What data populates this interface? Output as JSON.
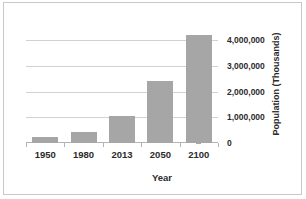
{
  "chart_data": {
    "type": "bar",
    "title": "",
    "xlabel": "Year",
    "ylabel": "Population (Thousands)",
    "categories": [
      "1950",
      "1980",
      "2013",
      "2050",
      "2100"
    ],
    "values": [
      250000,
      440000,
      1050000,
      2400000,
      4200000
    ],
    "series": [
      {
        "name": "Population (Thousands)",
        "values": [
          250000,
          440000,
          1050000,
          2400000,
          4200000
        ]
      }
    ],
    "ylim": [
      0,
      4600000
    ],
    "yticks": [
      0,
      1000000,
      2000000,
      3000000,
      4000000
    ],
    "ytick_labels": [
      "0",
      "1,000,000",
      "2,000,000",
      "3,000,000",
      "4,000,000"
    ],
    "grid": true,
    "legend": false,
    "y_axis_position": "right",
    "bar_color": "#a6a6a6",
    "gridline_color": "#d2d2d2",
    "text_color": "#2b2b2b",
    "border_color": "#c9c9c9",
    "background_color": "#ffffff"
  }
}
